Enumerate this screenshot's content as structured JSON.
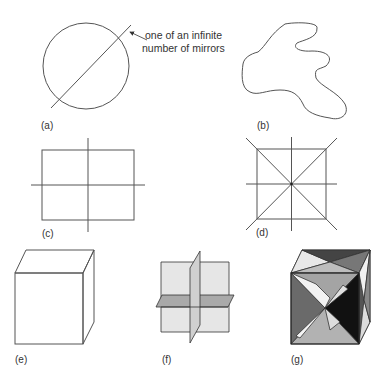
{
  "figure": {
    "panels": [
      {
        "id": "a",
        "label": "(a)",
        "shape": "circle",
        "mirrors": "infinite",
        "annotation": {
          "line1": "one of an infinite",
          "line2": "number of mirrors"
        }
      },
      {
        "id": "b",
        "label": "(b)",
        "shape": "irregular blob",
        "mirrors": 0
      },
      {
        "id": "c",
        "label": "(c)",
        "shape": "rectangle",
        "mirrors": 2
      },
      {
        "id": "d",
        "label": "(d)",
        "shape": "square",
        "mirrors": 4
      },
      {
        "id": "e",
        "label": "(e)",
        "shape": "cube"
      },
      {
        "id": "f",
        "label": "(f)",
        "shape": "three perpendicular mirror planes"
      },
      {
        "id": "g",
        "label": "(g)",
        "shape": "cube with diagonal mirror planes"
      }
    ]
  },
  "colors": {
    "line": "#555555",
    "text": "#333333",
    "plane_light": "#e4e4e4",
    "plane_mid": "#a8a8a8",
    "plane_dark": "#333333"
  }
}
